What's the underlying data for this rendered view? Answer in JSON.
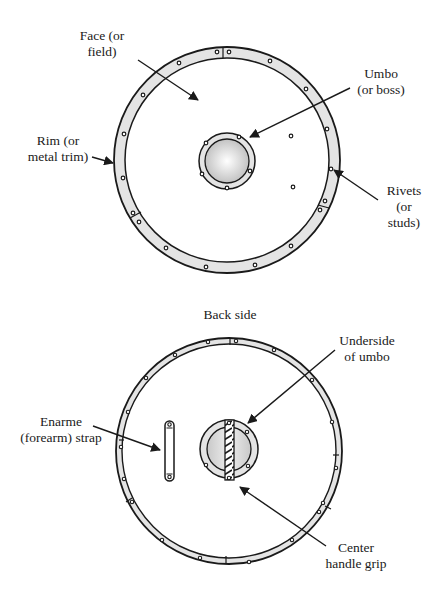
{
  "front": {
    "labels": {
      "face": [
        "Face (or",
        "field)"
      ],
      "umbo": [
        "Umbo",
        "(or boss)"
      ],
      "rim": [
        "Rim  (or",
        "metal trim)"
      ],
      "rivets": [
        "Rivets",
        "(or",
        "studs)"
      ]
    }
  },
  "back": {
    "title": "Back side",
    "labels": {
      "underside": [
        "Underside",
        "of umbo"
      ],
      "strap": [
        "Enarme",
        "(forearm) strap"
      ],
      "grip": [
        "Center",
        "handle grip"
      ]
    }
  },
  "colors": {
    "stroke": "#1a1a1a",
    "rim_fill": "#e4e4e4",
    "boss_light": "#ffffff",
    "boss_dark": "#bdbdbd"
  }
}
